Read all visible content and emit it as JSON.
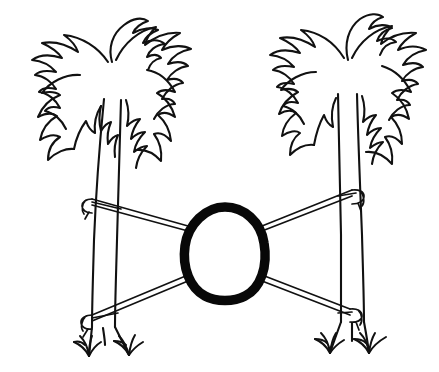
{
  "canvas": {
    "width": 439,
    "height": 372,
    "background_color": "#ffffff",
    "ink_color": "#111111",
    "accent_color": "#080808",
    "style": "black-and-white hand-drawn line art"
  },
  "artwork": {
    "title": "Two palm trees with a hammock rope and a central egg shape",
    "subject": "palm-trees-hammock-egg",
    "medium": "ink line drawing"
  },
  "elements": {
    "left_tree": {
      "label": "Left palm tree",
      "crown_label": "Left palm crown fronds",
      "trunk_label": "Left palm trunk",
      "frond_count": 9,
      "crown_center_x": 110,
      "crown_center_y": 70
    },
    "right_tree": {
      "label": "Right palm tree",
      "crown_label": "Right palm crown fronds",
      "trunk_label": "Right palm trunk",
      "frond_count": 9,
      "crown_center_x": 348,
      "crown_center_y": 62
    },
    "hammock": {
      "label": "Hammock rope lines",
      "upper_rope_label": "Upper rope span",
      "lower_rope_label": "Lower rope span",
      "knot_count": 4,
      "knot_labels": [
        "Upper-left rope knot on trunk",
        "Upper-right rope knot on trunk",
        "Lower-left rope knot on trunk",
        "Lower-right rope knot on trunk"
      ]
    },
    "center_shape": {
      "label": "Central egg outline",
      "shape": "egg",
      "stroke_width_px": 10,
      "color": "#080808",
      "bounds": {
        "x": 185,
        "y": 205,
        "width": 80,
        "height": 96
      }
    },
    "ground": {
      "label": "Grass tufts",
      "tuft_count": 4
    }
  }
}
